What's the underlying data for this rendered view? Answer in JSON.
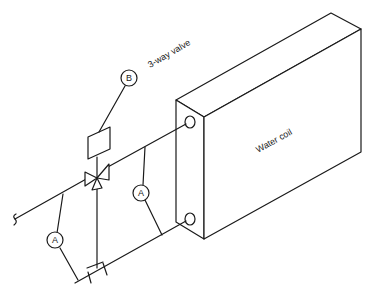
{
  "diagram": {
    "type": "piping-schematic",
    "labels": {
      "valve": "3-way valve",
      "coil": "Water coil"
    },
    "tags": {
      "actuator": "B",
      "sensor_supply": "A",
      "sensor_return": "A"
    },
    "colors": {
      "line": "#1a1a1a",
      "background": "#ffffff"
    }
  }
}
